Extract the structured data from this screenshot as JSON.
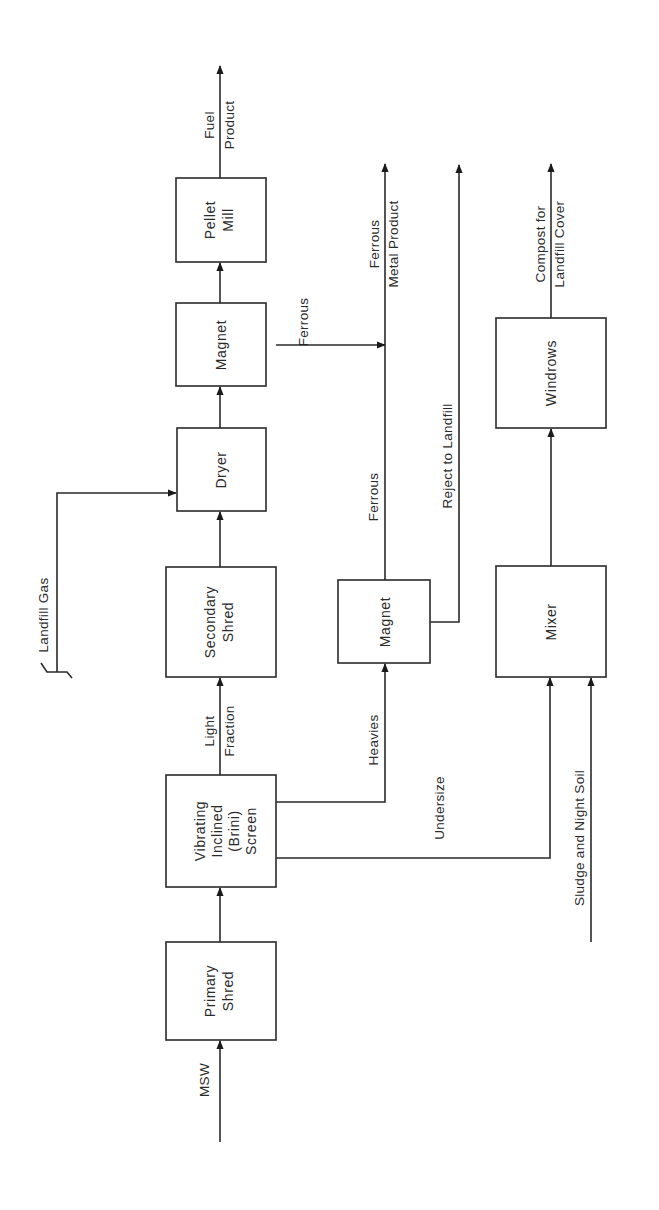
{
  "diagram": {
    "orientation": "rotated-90-ccw",
    "nodes": {
      "primary_shred": {
        "line1": "Primary",
        "line2": "Shred"
      },
      "screen": {
        "line1": "Vibrating",
        "line2": "Inclined",
        "line3": "(Brini)",
        "line4": "Screen"
      },
      "secondary_shred": {
        "line1": "Secondary",
        "line2": "Shred"
      },
      "dryer": {
        "line1": "Dryer"
      },
      "magnet_top": {
        "line1": "Magnet"
      },
      "pellet_mill": {
        "line1": "Pellet",
        "line2": "Mill"
      },
      "magnet_heavies": {
        "line1": "Magnet"
      },
      "mixer": {
        "line1": "Mixer"
      },
      "windrows": {
        "line1": "Windrows"
      }
    },
    "flows": {
      "msw": "MSW",
      "light_fraction_1": "Light",
      "light_fraction_2": "Fraction",
      "heavies": "Heavies",
      "undersize": "Undersize",
      "landfill_gas": "Landfill Gas",
      "ferrous_top": "Ferrous",
      "ferrous_heavies": "Ferrous",
      "fuel_product_1": "Fuel",
      "fuel_product_2": "Product",
      "ferrous_metal_product_1": "Ferrous",
      "ferrous_metal_product_2": "Metal Product",
      "reject": "Reject to Landfill",
      "compost_1": "Compost for",
      "compost_2": "Landfill Cover",
      "sludge": "Sludge and Night Soil"
    },
    "edges": [
      {
        "from": "MSW",
        "to": "Primary Shred"
      },
      {
        "from": "Primary Shred",
        "to": "Vibrating Inclined (Brini) Screen"
      },
      {
        "from": "Vibrating Inclined (Brini) Screen",
        "to": "Secondary Shred",
        "label": "Light Fraction"
      },
      {
        "from": "Vibrating Inclined (Brini) Screen",
        "to": "Magnet (heavies)",
        "label": "Heavies"
      },
      {
        "from": "Vibrating Inclined (Brini) Screen",
        "to": "Mixer",
        "label": "Undersize"
      },
      {
        "from": "Secondary Shred",
        "to": "Dryer"
      },
      {
        "from": "Landfill Gas",
        "to": "Dryer"
      },
      {
        "from": "Dryer",
        "to": "Magnet"
      },
      {
        "from": "Magnet",
        "to": "Pellet Mill"
      },
      {
        "from": "Magnet",
        "to": "Ferrous Metal Product",
        "label": "Ferrous"
      },
      {
        "from": "Pellet Mill",
        "to": "Fuel Product"
      },
      {
        "from": "Magnet (heavies)",
        "to": "Ferrous Metal Product",
        "label": "Ferrous"
      },
      {
        "from": "Magnet (heavies)",
        "to": "Reject to Landfill"
      },
      {
        "from": "Sludge and Night Soil",
        "to": "Mixer"
      },
      {
        "from": "Mixer",
        "to": "Windrows"
      },
      {
        "from": "Windrows",
        "to": "Compost for Landfill Cover"
      }
    ]
  }
}
